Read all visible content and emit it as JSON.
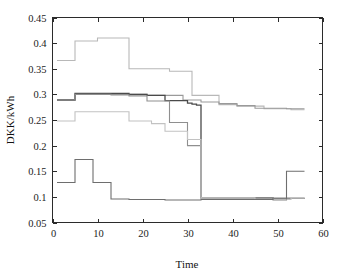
{
  "figure": {
    "width": 342,
    "height": 279,
    "background": "#ffffff",
    "frame_color": "#2b2b2b"
  },
  "chart_data": {
    "type": "line",
    "title": "",
    "subtitle": "",
    "xlabel": "Time",
    "ylabel": "DKK/kWh",
    "xlim": [
      0,
      60
    ],
    "ylim": [
      0.05,
      0.45
    ],
    "xticks": [
      0,
      10,
      20,
      30,
      40,
      50,
      60
    ],
    "xtick_labels": [
      "0",
      "10",
      "20",
      "30",
      "40",
      "50",
      "60"
    ],
    "yticks": [
      0.05,
      0.1,
      0.15,
      0.2,
      0.25,
      0.3,
      0.35,
      0.4,
      0.45
    ],
    "ytick_labels": [
      "0.05",
      "0.1",
      "0.15",
      "0.2",
      "0.25",
      "0.3",
      "0.35",
      "0.4",
      "0.45"
    ],
    "grid": false,
    "legend": "none",
    "legend_position": "none",
    "step_style": "post",
    "series": [
      {
        "name": "series-1-top",
        "color": "#b8b8b8",
        "width": 1.1,
        "x": [
          1,
          4,
          5,
          9,
          10,
          13,
          17,
          22,
          26,
          29,
          31,
          33,
          37,
          41,
          45,
          47,
          51,
          53,
          56
        ],
        "values": [
          0.366,
          0.366,
          0.404,
          0.404,
          0.41,
          0.41,
          0.35,
          0.35,
          0.345,
          0.345,
          0.298,
          0.298,
          0.28,
          0.277,
          0.277,
          0.272,
          0.272,
          0.27,
          0.27
        ]
      },
      {
        "name": "series-2-upper-mid",
        "color": "#9a9a9a",
        "width": 1.1,
        "x": [
          1,
          4,
          5,
          9,
          13,
          17,
          21,
          25,
          29,
          31,
          33,
          37,
          41,
          45,
          49,
          52,
          53,
          56
        ],
        "values": [
          0.289,
          0.289,
          0.3,
          0.3,
          0.3,
          0.3,
          0.298,
          0.298,
          0.289,
          0.289,
          0.285,
          0.282,
          0.278,
          0.273,
          0.273,
          0.272,
          0.272,
          0.272
        ]
      },
      {
        "name": "series-3-dark-mid",
        "color": "#4a4a4a",
        "width": 1.3,
        "x": [
          1,
          4,
          5,
          9,
          13,
          17,
          21,
          25,
          28,
          30,
          31,
          32,
          33,
          37,
          41,
          45,
          49,
          52,
          53,
          56
        ],
        "values": [
          0.289,
          0.289,
          0.302,
          0.302,
          0.302,
          0.3,
          0.298,
          0.288,
          0.288,
          0.283,
          0.281,
          0.279,
          0.098,
          0.098,
          0.098,
          0.098,
          0.097,
          0.097,
          0.097,
          0.097
        ]
      },
      {
        "name": "series-4-descending",
        "color": "#8f8f8f",
        "width": 1.1,
        "x": [
          1,
          4,
          5,
          9,
          13,
          17,
          21,
          25,
          26,
          29,
          30,
          32,
          33,
          37,
          41,
          45,
          49,
          52,
          53,
          56
        ],
        "values": [
          0.289,
          0.289,
          0.3,
          0.3,
          0.299,
          0.297,
          0.287,
          0.287,
          0.245,
          0.245,
          0.2,
          0.2,
          0.098,
          0.098,
          0.098,
          0.098,
          0.097,
          0.097,
          0.097,
          0.097
        ]
      },
      {
        "name": "series-5-lower-mid",
        "color": "#c2c2c2",
        "width": 1.1,
        "x": [
          1,
          4,
          5,
          9,
          13,
          17,
          20,
          22,
          25,
          28,
          30,
          32,
          33,
          37,
          41,
          45,
          49,
          52,
          53,
          56
        ],
        "values": [
          0.248,
          0.248,
          0.266,
          0.266,
          0.266,
          0.248,
          0.248,
          0.243,
          0.228,
          0.228,
          0.212,
          0.212,
          0.098,
          0.098,
          0.098,
          0.095,
          0.093,
          0.095,
          0.098,
          0.098
        ]
      },
      {
        "name": "series-6-bottom",
        "color": "#6e6e6e",
        "width": 1.1,
        "x": [
          1,
          4,
          5,
          8,
          9,
          12,
          13,
          17,
          21,
          25,
          29,
          33,
          37,
          41,
          45,
          49,
          51,
          52,
          53,
          56
        ],
        "values": [
          0.128,
          0.128,
          0.173,
          0.173,
          0.128,
          0.128,
          0.096,
          0.095,
          0.095,
          0.094,
          0.094,
          0.095,
          0.095,
          0.095,
          0.095,
          0.096,
          0.096,
          0.15,
          0.15,
          0.15
        ]
      }
    ]
  }
}
